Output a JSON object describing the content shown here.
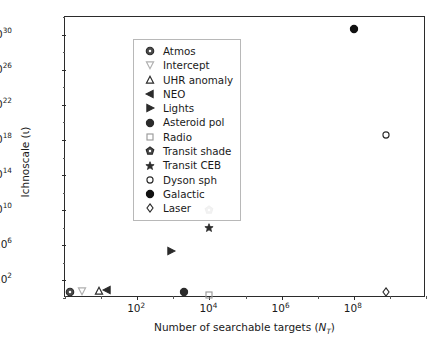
{
  "chart_data": {
    "type": "scatter",
    "title": "",
    "xlabel": "Number of searchable targets (N_T)",
    "ylabel": "Ichnoscale (ι)",
    "xscale": "log",
    "yscale": "log",
    "xlim": [
      1,
      10000000000.0
    ],
    "ylim": [
      1,
      1e+32
    ],
    "grid": false,
    "legend_position": "upper left",
    "xticks": [
      100,
      10000,
      1000000,
      100000000
    ],
    "xticklabels": [
      "10^2",
      "10^4",
      "10^6",
      "10^8"
    ],
    "yticks": [
      100,
      1000000,
      10000000000.0,
      100000000000000.0,
      1e+18,
      1e+22,
      1e+26,
      1e+30
    ],
    "yticklabels": [
      "10^2",
      "10^6",
      "10^10",
      "10^14",
      "10^18",
      "10^22",
      "10^26",
      "10^30"
    ],
    "series": [
      {
        "name": "Atmos",
        "marker": "circle-dot",
        "fill": "#4a4a4a",
        "edge": "#2b2b2b",
        "x": 1.4,
        "y": 5.0
      },
      {
        "name": "Intercept",
        "marker": "triangle-down",
        "fill": "none",
        "edge": "#b0b0b0",
        "x": 3.0,
        "y": 6.5
      },
      {
        "name": "UHR anomaly",
        "marker": "triangle-up",
        "fill": "none",
        "edge": "#2b2b2b",
        "x": 9.0,
        "y": 6.0
      },
      {
        "name": "NEO",
        "marker": "triangle-left",
        "fill": "#2b2b2b",
        "edge": "#2b2b2b",
        "x": 15.0,
        "y": 9.0
      },
      {
        "name": "Lights",
        "marker": "triangle-right",
        "fill": "#2b2b2b",
        "edge": "#2b2b2b",
        "x": 850.0,
        "y": 200000.0
      },
      {
        "name": "Asteroid pol",
        "marker": "circle",
        "fill": "#2b2b2b",
        "edge": "#2b2b2b",
        "x": 2000.0,
        "y": 5.0
      },
      {
        "name": "Radio",
        "marker": "square",
        "fill": "none",
        "edge": "#9a9a9a",
        "x": 10000.0,
        "y": 2.0
      },
      {
        "name": "Transit shade",
        "marker": "pentagon-dot",
        "fill": "#4a4a4a",
        "edge": "#2b2b2b",
        "x": 9500.0,
        "y": 10000000000.0
      },
      {
        "name": "Transit CEB",
        "marker": "star",
        "fill": "#2b2b2b",
        "edge": "#2b2b2b",
        "x": 9500.0,
        "y": 100000000.0
      },
      {
        "name": "Dyson sph",
        "marker": "circle-open",
        "fill": "none",
        "edge": "#2b2b2b",
        "x": 800000000.0,
        "y": 4e+18
      },
      {
        "name": "Galactic",
        "marker": "circle-filled",
        "fill": "#111111",
        "edge": "#111111",
        "x": 100000000.0,
        "y": 4e+30
      },
      {
        "name": "Laser",
        "marker": "diamond",
        "fill": "none",
        "edge": "#2b2b2b",
        "x": 800000000.0,
        "y": 5.0
      }
    ]
  },
  "axes": {
    "xlabel_prefix": "Number of searchable targets (",
    "xlabel_italic": "N",
    "xlabel_sub": "T",
    "xlabel_suffix": ")",
    "ylabel_text": "Ichnoscale (ι)"
  },
  "colors": {
    "background": "#ffffff",
    "frame": "#2b2b2b",
    "text": "#1a1a1a",
    "legend_border": "#b8b8b8",
    "marker_dark": "#2b2b2b",
    "marker_light": "#b0b0b0"
  }
}
